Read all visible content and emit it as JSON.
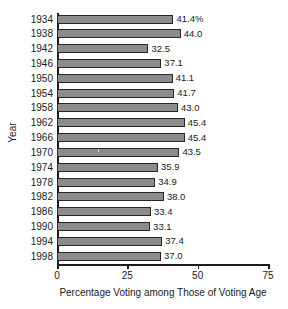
{
  "chart_data": {
    "type": "bar",
    "orientation": "horizontal",
    "title": "",
    "xlabel": "Percentage Voting among Those of Voting Age",
    "ylabel": "Year",
    "xlim": [
      0,
      75
    ],
    "xticks": [
      0,
      25,
      50,
      75
    ],
    "xtick_labels": [
      "0",
      "25",
      "50",
      "75"
    ],
    "grid": false,
    "legend": false,
    "categories": [
      "1934",
      "1938",
      "1942",
      "1946",
      "1950",
      "1954",
      "1958",
      "1962",
      "1966",
      "1970",
      "1974",
      "1978",
      "1982",
      "1986",
      "1990",
      "1994",
      "1998"
    ],
    "values": [
      41.4,
      44.0,
      32.5,
      37.1,
      41.1,
      41.7,
      43.0,
      45.4,
      45.4,
      43.5,
      35.9,
      34.9,
      38.0,
      33.4,
      33.1,
      37.4,
      37.0
    ],
    "data_labels": [
      "41.4%",
      "44.0",
      "32.5",
      "37.1",
      "41.1",
      "41.7",
      "43.0",
      "45.4",
      "45.4",
      "43.5",
      "35.9",
      "34.9",
      "38.0",
      "33.4",
      "33.1",
      "37.4",
      "37.0"
    ],
    "bar_color": "#8c8c8c",
    "bar_edge_color": "#262626"
  }
}
